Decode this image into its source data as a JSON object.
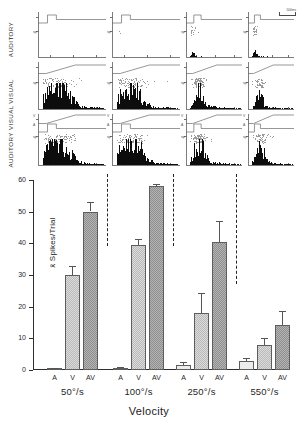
{
  "figure": {
    "row_labels": {
      "auditory": "AUDITORY",
      "visual": "VISUAL",
      "auditory_visual": "AUDITORY VISUAL"
    },
    "scale_bar": {
      "label": "500ms"
    },
    "trace_labels": {
      "visual": "V",
      "auditory": "A",
      "spikes": "sp"
    }
  },
  "chart_data": {
    "type": "bar",
    "title": "",
    "xlabel": "Velocity",
    "ylabel": "x̄ Spikes/Trial",
    "ylim": [
      0,
      60
    ],
    "yticks": [
      0,
      10,
      20,
      30,
      40,
      50,
      60
    ],
    "ytick_labels": [
      "0",
      "10",
      "20",
      "30",
      "40",
      "50",
      "60"
    ],
    "grid": false,
    "legend": "none",
    "categories": [
      "50°/s",
      "100°/s",
      "250°/s",
      "550°/s"
    ],
    "condition_labels": [
      "A",
      "V",
      "AV"
    ],
    "series": [
      {
        "name": "A",
        "values": [
          0.3,
          0.5,
          1.7,
          2.8
        ],
        "errors": [
          0.2,
          0.3,
          0.9,
          1.0
        ]
      },
      {
        "name": "V",
        "values": [
          30.0,
          39.5,
          18.0,
          8.0
        ],
        "errors": [
          2.8,
          1.8,
          6.2,
          2.2
        ]
      },
      {
        "name": "AV",
        "values": [
          50.0,
          58.0,
          40.5,
          14.2
        ],
        "errors": [
          3.0,
          0.8,
          6.5,
          4.5
        ]
      }
    ],
    "separators_after_group": [
      1,
      2,
      3,
      4
    ]
  }
}
